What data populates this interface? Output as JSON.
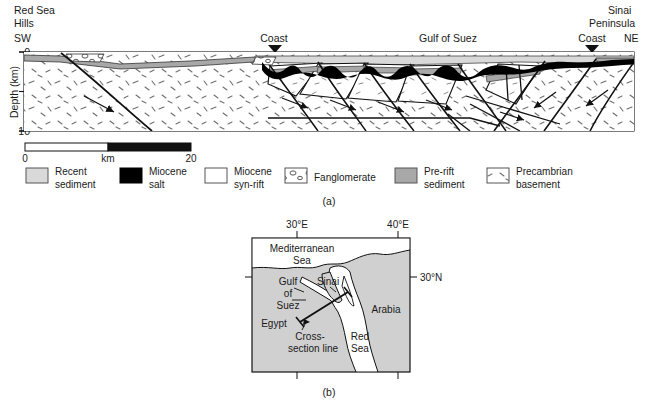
{
  "figure": {
    "panel_a_label": "(a)",
    "panel_b_label": "(b)"
  },
  "cross_section": {
    "left_region_line1": "Red Sea",
    "left_region_line2": "Hills",
    "left_direction": "SW",
    "right_region_line1": "Sinai",
    "right_region_line2": "Peninsula",
    "right_direction": "NE",
    "coast_left": "Coast",
    "coast_right": "Coast",
    "basin_label": "Gulf of Suez",
    "y_axis_label": "Depth (km)",
    "y_ticks": [
      "0",
      "10"
    ],
    "y_min": 0,
    "y_max": 10,
    "scale_bar": {
      "start": "0",
      "unit": "km",
      "end": "20"
    }
  },
  "legend": {
    "items": [
      {
        "line1": "Recent",
        "line2": "sediment",
        "swatch": "recent-sediment",
        "color": "#d9d9d9"
      },
      {
        "line1": "Miocene",
        "line2": "salt",
        "swatch": "miocene-salt",
        "color": "#000000"
      },
      {
        "line1": "Miocene",
        "line2": "syn-rift",
        "swatch": "miocene-synrift",
        "color": "#ffffff"
      },
      {
        "line1": "Fanglomerate",
        "line2": "",
        "swatch": "fanglomerate",
        "color": "#ffffff"
      },
      {
        "line1": "Pre-rift",
        "line2": "sediment",
        "swatch": "pre-rift-sediment",
        "color": "#a8a8a8"
      },
      {
        "line1": "Precambrian",
        "line2": "basement",
        "swatch": "precambrian-basement",
        "color": "#ffffff"
      }
    ]
  },
  "inset_map": {
    "background_color": "#d0d0d0",
    "sea_color": "#ffffff",
    "coord_top_left": "30°E",
    "coord_top_right": "40°E",
    "coord_right": "30°N",
    "places": [
      {
        "name": "mediterranean-sea",
        "line1": "Mediterranean",
        "line2": "Sea"
      },
      {
        "name": "gulf-of-suez",
        "line1": "Gulf",
        "line2": "of",
        "line3": "Suez"
      },
      {
        "name": "sinai",
        "line1": "Sinai",
        "line2": ""
      },
      {
        "name": "arabia",
        "line1": "Arabia",
        "line2": ""
      },
      {
        "name": "egypt",
        "line1": "Egypt",
        "line2": ""
      },
      {
        "name": "red-sea",
        "line1": "Red",
        "line2": "Sea"
      },
      {
        "name": "cross-section-line",
        "line1": "Cross-",
        "line2": "section line"
      }
    ]
  }
}
